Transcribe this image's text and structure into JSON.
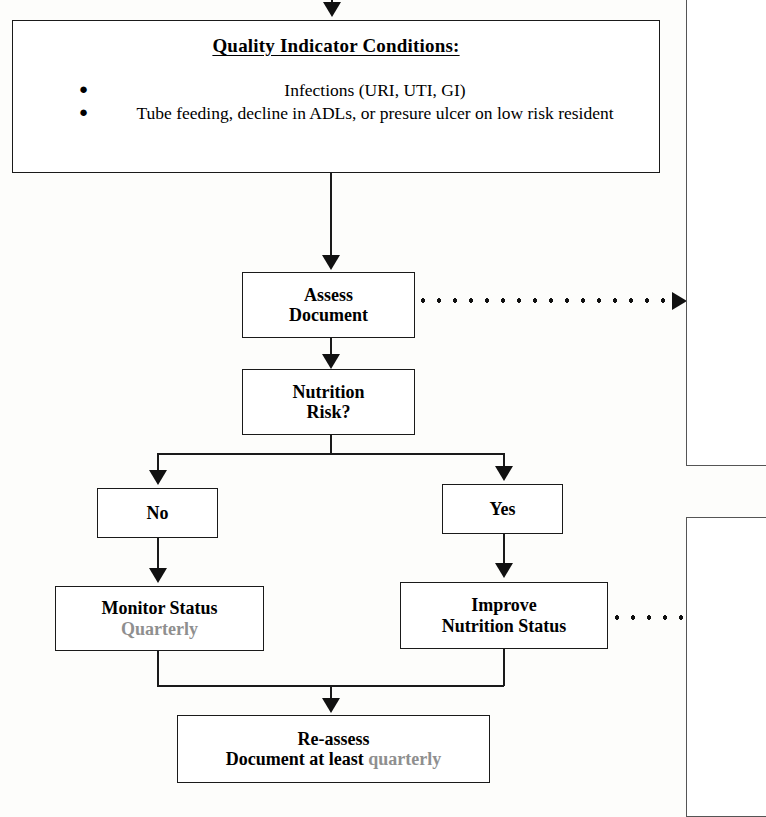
{
  "diagram": {
    "conditions_box": {
      "heading": "Quality Indicator Conditions:",
      "bullet_glyph": "●",
      "items": [
        "Infections (URI, UTI, GI)",
        "Tube feeding, decline in ADLs, or presure ulcer on low risk resident"
      ]
    },
    "nodes": {
      "assess": {
        "line1": "Assess",
        "line2": "Document"
      },
      "risk": {
        "line1": "Nutrition",
        "line2": "Risk?"
      },
      "no": {
        "label": "No"
      },
      "yes": {
        "label": "Yes"
      },
      "monitor": {
        "line1": "Monitor Status",
        "line2": "Quarterly"
      },
      "improve": {
        "line1": "Improve",
        "line2": "Nutrition Status"
      },
      "reassess": {
        "line1": "Re-assess",
        "line2_bold": "Document at least ",
        "line2_gray": "quarterly"
      }
    },
    "colors": {
      "ink": "#1a1a1a",
      "gray_text": "#8f8f8f",
      "box_fill": "#ffffff",
      "page": "#fdfdfb"
    }
  }
}
